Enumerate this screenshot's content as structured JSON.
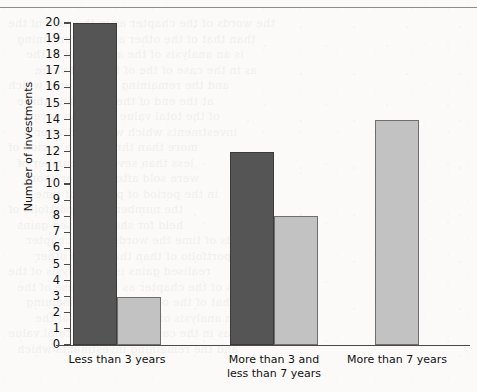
{
  "page": {
    "background_color": "#fbfaf8",
    "rule_color": "#8c8c8c"
  },
  "bleed_text": [
    "the words of the chapter",
    "than that of the other",
    "is an analysis of the",
    "as in the case of the",
    "and the remaining",
    "at the end of the",
    "of the total value",
    "investments which",
    "more than three",
    "less than seven",
    "were sold after",
    "in the period of",
    "the number of",
    "held for short",
    "periods of time",
    "the portfolio of",
    "realised gains"
  ],
  "chart_data": {
    "type": "bar",
    "title": "",
    "xlabel": "",
    "ylabel": "Number of investments",
    "ylim": [
      0,
      20
    ],
    "ytick_step": 1,
    "grid": false,
    "legend": "none",
    "categories": [
      "Less than 3 years",
      "More than 3 and\nless than 7 years",
      "More than 7 years"
    ],
    "series": [
      {
        "name": "dark",
        "color": "#555555",
        "edge_color": "#3b3b3b",
        "values": [
          20,
          12,
          null
        ]
      },
      {
        "name": "light",
        "color": "#c2c2c2",
        "edge_color": "#6f6f6f",
        "values": [
          3,
          8,
          14
        ]
      }
    ],
    "ytick_labels": [
      "0",
      "1",
      "2",
      "3",
      "4",
      "5",
      "6",
      "7",
      "8",
      "9",
      "10",
      "11",
      "12",
      "13",
      "14",
      "15",
      "16",
      "17",
      "18",
      "19",
      "20"
    ]
  },
  "geometry": {
    "axis_left_px": 70,
    "axis_bottom_px": 345,
    "axis_top_px": 23,
    "axis_right_px": 470,
    "bar_width_px": 44,
    "group_starts_px": [
      73,
      230,
      375
    ]
  }
}
